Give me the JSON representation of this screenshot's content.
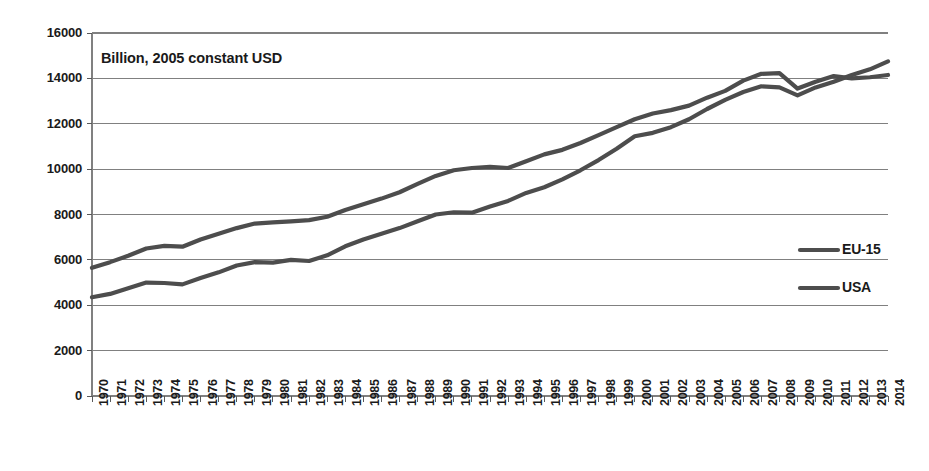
{
  "chart_data": {
    "type": "line",
    "title": "",
    "annotation": "Billion, 2005 constant USD",
    "xlabel": "",
    "ylabel": "",
    "ylim": [
      0,
      16000
    ],
    "ytick_step": 2000,
    "yticks": [
      "0",
      "2000",
      "4000",
      "6000",
      "8000",
      "10000",
      "12000",
      "14000",
      "16000"
    ],
    "grid": true,
    "legend_position": "right-inside",
    "x": [
      1970,
      1971,
      1972,
      1973,
      1974,
      1975,
      1976,
      1977,
      1978,
      1979,
      1980,
      1981,
      1982,
      1983,
      1984,
      1985,
      1986,
      1987,
      1988,
      1989,
      1990,
      1991,
      1992,
      1993,
      1994,
      1995,
      1996,
      1997,
      1998,
      1999,
      2000,
      2001,
      2002,
      2003,
      2004,
      2005,
      2006,
      2007,
      2008,
      2009,
      2010,
      2011,
      2012,
      2013,
      2014
    ],
    "xtick_labels": [
      "1970",
      "1971",
      "1972",
      "1973",
      "1974",
      "1975",
      "1976",
      "1977",
      "1978",
      "1979",
      "1980",
      "1981",
      "1982",
      "1983",
      "1984",
      "1985",
      "1986",
      "1987",
      "1988",
      "1989",
      "1990",
      "1991",
      "1992",
      "1993",
      "1994",
      "1995",
      "1996",
      "1997",
      "1998",
      "1999",
      "2000",
      "2001",
      "2002",
      "2003",
      "2004",
      "2005",
      "2006",
      "2007",
      "2008",
      "2009",
      "2010",
      "2011",
      "2012",
      "2013",
      "2014"
    ],
    "series": [
      {
        "name": "EU-15",
        "color": "#4d4d4d",
        "values": [
          5650,
          5900,
          6180,
          6500,
          6620,
          6580,
          6900,
          7150,
          7400,
          7600,
          7650,
          7700,
          7750,
          7900,
          8200,
          8450,
          8700,
          8980,
          9350,
          9700,
          9950,
          10050,
          10100,
          10050,
          10350,
          10650,
          10850,
          11150,
          11500,
          11850,
          12200,
          12450,
          12600,
          12800,
          13150,
          13450,
          13900,
          14200,
          14230,
          13550,
          13850,
          14100,
          14000,
          14050,
          14150
        ]
      },
      {
        "name": "USA",
        "color": "#4d4d4d",
        "values": [
          4350,
          4500,
          4750,
          5000,
          4980,
          4920,
          5200,
          5450,
          5750,
          5900,
          5880,
          6000,
          5950,
          6200,
          6600,
          6900,
          7150,
          7400,
          7700,
          8000,
          8100,
          8080,
          8350,
          8600,
          8950,
          9200,
          9550,
          9950,
          10400,
          10900,
          11450,
          11600,
          11850,
          12200,
          12650,
          13050,
          13400,
          13650,
          13600,
          13250,
          13600,
          13850,
          14150,
          14400,
          14750
        ]
      }
    ]
  },
  "legend": {
    "items": [
      {
        "label": "EU-15"
      },
      {
        "label": "USA"
      }
    ]
  }
}
